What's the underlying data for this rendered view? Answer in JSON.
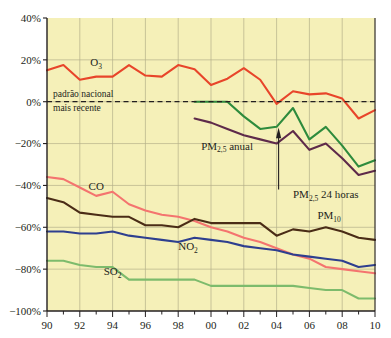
{
  "chart_data": {
    "type": "line",
    "title": "",
    "subtitle": "",
    "xlabel": "",
    "ylabel": "",
    "xlim": [
      1990,
      2010
    ],
    "ylim": [
      -100,
      40
    ],
    "grid": true,
    "legend_position": "inline-labels",
    "y_tick_labels": [
      "40%",
      "20%",
      "0%",
      "−20%",
      "−40%",
      "−60%",
      "−80%",
      "−100%"
    ],
    "y_tick_values": [
      40,
      20,
      0,
      -20,
      -40,
      -60,
      -80,
      -100
    ],
    "x_tick_labels": [
      "90",
      "92",
      "94",
      "96",
      "98",
      "00",
      "02",
      "04",
      "06",
      "08",
      "10"
    ],
    "x_tick_values": [
      1990,
      1992,
      1994,
      1996,
      1998,
      2000,
      2002,
      2004,
      2006,
      2008,
      2010
    ],
    "x": [
      1990,
      1991,
      1992,
      1993,
      1994,
      1995,
      1996,
      1997,
      1998,
      1999,
      2000,
      2001,
      2002,
      2003,
      2004,
      2005,
      2006,
      2007,
      2008,
      2009,
      2010
    ],
    "annotations": [
      {
        "name": "reference-line-note",
        "text_line1": "padrão nacional",
        "text_line2": "mais recente",
        "value": 0,
        "style": "dashed"
      },
      {
        "name": "pm25-24h-callout",
        "text": "PM2,5 24 horas",
        "text_main": "PM",
        "text_sub": "2,5",
        "text_tail": " 24 horas",
        "points_to_year": 2004
      }
    ],
    "series": [
      {
        "name": "O3",
        "label_main": "O",
        "label_sub": "3",
        "color": "#e8452a",
        "values": [
          15,
          17.5,
          10.5,
          12,
          12,
          17.5,
          12.5,
          12,
          17.5,
          15.5,
          8,
          11,
          16,
          10.5,
          -1,
          5,
          3.5,
          4,
          1.5,
          -8,
          -4
        ],
        "label_x": 1993,
        "label_y": 17
      },
      {
        "name": "PM2,5 24 horas",
        "label_main": "PM",
        "label_sub": "2,5",
        "label_tail": " 24 horas",
        "color": "#2e8b3d",
        "values": [
          null,
          null,
          null,
          null,
          null,
          null,
          null,
          null,
          null,
          0,
          0,
          0,
          -7,
          -13,
          -12,
          -3,
          -18,
          -12,
          -21,
          -31,
          -28
        ],
        "label_x": 2005,
        "label_y": -46
      },
      {
        "name": "PM2,5 anual",
        "label_main": "PM",
        "label_sub": "2,5",
        "label_tail": " anual",
        "color": "#5e2a4a",
        "values": [
          null,
          null,
          null,
          null,
          null,
          null,
          null,
          null,
          null,
          -8,
          -10,
          -13,
          -16,
          -18,
          -20,
          -14,
          -23,
          -20,
          -27,
          -35,
          -33
        ],
        "label_x": 1999.4,
        "label_y": -23
      },
      {
        "name": "CO",
        "color": "#f4746f",
        "values": [
          -36,
          -37,
          -41,
          -45,
          -43,
          -49,
          -52,
          -54,
          -55,
          -57,
          -60,
          -62,
          -65,
          -67,
          -70,
          -73,
          -75,
          -79,
          -80,
          -81,
          -82
        ],
        "label_x": 1993,
        "label_y": -42
      },
      {
        "name": "PM10",
        "label_main": "PM",
        "label_sub": "10",
        "color": "#4a2c16",
        "values": [
          -46,
          -48,
          -53,
          -54,
          -55,
          -55,
          -59,
          -59,
          -60,
          -56,
          -58,
          -58,
          -58,
          -58,
          -64,
          -61,
          -62,
          -60,
          -62,
          -65,
          -66
        ],
        "label_x": 2007.2,
        "label_y": -56
      },
      {
        "name": "NO2",
        "label_main": "NO",
        "label_sub": "2",
        "color": "#2e3f8f",
        "values": [
          -62,
          -62,
          -63,
          -63,
          -62,
          -64,
          -65,
          -66,
          -67,
          -65,
          -66,
          -67,
          -69,
          -70,
          -71,
          -73,
          -74,
          -75,
          -76,
          -79,
          -78
        ],
        "label_x": 1998.6,
        "label_y": -71
      },
      {
        "name": "SO2",
        "label_main": "SO",
        "label_sub": "2",
        "color": "#7dbb6c",
        "values": [
          -76,
          -76,
          -78,
          -79,
          -79,
          -85,
          -85,
          -85,
          -85,
          -85,
          -88,
          -88,
          -88,
          -88,
          -88,
          -88,
          -89,
          -90,
          -90,
          -94,
          -94
        ],
        "label_x": 1994,
        "label_y": -83
      }
    ]
  },
  "colors": {
    "plot_background": "#f5f0b8",
    "grid": "#b5b08a",
    "axis": "#231f20",
    "page_background": "#ffffff"
  }
}
